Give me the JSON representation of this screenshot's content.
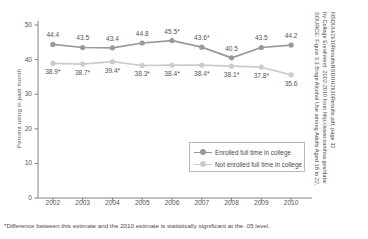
{
  "chart_data": {
    "type": "line",
    "title": "",
    "xlabel": "",
    "ylabel": "Percent using in past month",
    "categories": [
      "2002",
      "2003",
      "2004",
      "2005",
      "2006",
      "2007",
      "2008",
      "2009",
      "2010"
    ],
    "ylim": [
      0,
      50
    ],
    "yticks": [
      0,
      10,
      20,
      30,
      40,
      50
    ],
    "grid": false,
    "legend_position": "inside-lower-right",
    "series": [
      {
        "name": "Enrolled full time in college",
        "color": "#999999",
        "values": [
          44.4,
          43.5,
          43.4,
          44.8,
          45.5,
          43.6,
          40.5,
          43.5,
          44.2
        ],
        "labels": [
          "44.4",
          "43.5",
          "43.4",
          "44.8",
          "45.5*",
          "43.6*",
          "40.5",
          "43.5",
          "44.2"
        ]
      },
      {
        "name": "Not enrolled full time in college",
        "color": "#cccccc",
        "values": [
          38.9,
          38.7,
          39.4,
          38.3,
          38.4,
          38.4,
          38.1,
          37.8,
          35.6
        ],
        "labels": [
          "38.9*",
          "38.7*",
          "39.4*",
          "38.3*",
          "38.4*",
          "38.4*",
          "38.1*",
          "37.8*",
          "35.6"
        ]
      }
    ],
    "footnote": "*Difference between this estimate and the 2010 estimate is statistically significant at the .05 level.",
    "source_lines": [
      "SOURCE: Figure 3.3 Binge Alcohol Use among Adults Aged 18 to 22,",
      "by College Enrollment: 2002-2010 from http://www.samhsa.gov/data/",
      "NSDUH/2k10ResultsNSDUH2k10Results.pdf, page 32"
    ]
  },
  "colors": {
    "axis": "#777777",
    "text": "#4a4a4a",
    "series_enrolled": "#999999",
    "series_not_enrolled": "#cccccc",
    "legend_border": "#b9b9b9"
  }
}
